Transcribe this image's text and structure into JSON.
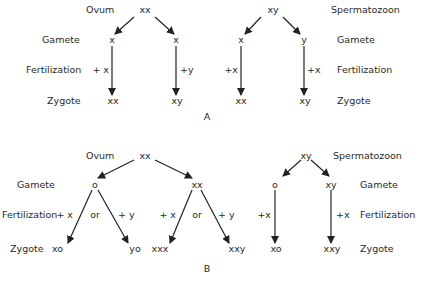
{
  "panelA": {
    "label": "A",
    "ovum": {
      "label": "Ovum",
      "genotype": "xx"
    },
    "sperm": {
      "label": "Spermatozoon",
      "genotype": "xy"
    },
    "rows": {
      "gamete": "Gamete",
      "fertilization": "Fertilization",
      "zygote": "Zygote"
    },
    "ovum_gametes": [
      "x",
      "x"
    ],
    "ovum_fert": [
      "+ x",
      "+y"
    ],
    "ovum_zygotes": [
      "xx",
      "xy"
    ],
    "sperm_gametes": [
      "x",
      "y"
    ],
    "sperm_fert": [
      "+x",
      "+x"
    ],
    "sperm_zygotes": [
      "xx",
      "xy"
    ]
  },
  "panelB": {
    "label": "B",
    "ovum": {
      "label": "Ovum",
      "genotype": "xx"
    },
    "sperm": {
      "label": "Spermatozoon",
      "genotype": "xy"
    },
    "rows": {
      "gamete": "Gamete",
      "fertilization": "Fertilization",
      "zygote": "Zygote"
    },
    "ovum_gametes": [
      "o",
      "xx"
    ],
    "ovum_fert": [
      "+ x",
      "or",
      "+ y",
      "+ x",
      "or",
      "+ y"
    ],
    "ovum_zygotes": [
      "xo",
      "yo",
      "xxx",
      "xxy"
    ],
    "sperm_gametes": [
      "o",
      "xy"
    ],
    "sperm_fert": [
      "+x",
      "+x"
    ],
    "sperm_zygotes": [
      "xo",
      "xxy"
    ]
  }
}
